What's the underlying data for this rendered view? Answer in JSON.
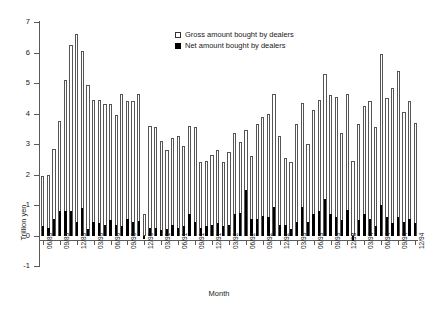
{
  "chart_data": {
    "type": "bar",
    "title": "",
    "xlabel": "Month",
    "ylabel": "Trillion yen",
    "ylim": [
      -1,
      7
    ],
    "ytick_labels": [
      "7",
      "6",
      "5",
      "4",
      "3",
      "2",
      "1",
      "0",
      "-1"
    ],
    "ytick_values": [
      7,
      6,
      5,
      4,
      3,
      2,
      1,
      0,
      -1
    ],
    "grid": false,
    "legend_position": "top-center",
    "legend": [
      {
        "name": "Gross amount bought by dealers",
        "swatch": "open-square"
      },
      {
        "name": "Net amount bought by dealers",
        "swatch": "filled-square"
      }
    ],
    "xtick_labels": [
      "06/89",
      "09/89",
      "12/89",
      "03/90",
      "06/90",
      "09/90",
      "12/90",
      "03/91",
      "06/91",
      "09/91",
      "12/91",
      "03/92",
      "06/92",
      "09/92",
      "12/92",
      "03/93",
      "06/93",
      "09/93",
      "12/93",
      "03/94",
      "06/94",
      "09/94",
      "12/94"
    ],
    "x": [
      "06/89",
      "07/89",
      "08/89",
      "09/89",
      "10/89",
      "11/89",
      "12/89",
      "01/90",
      "02/90",
      "03/90",
      "04/90",
      "05/90",
      "06/90",
      "07/90",
      "08/90",
      "09/90",
      "10/90",
      "11/90",
      "12/90",
      "01/91",
      "02/91",
      "03/91",
      "04/91",
      "05/91",
      "06/91",
      "07/91",
      "08/91",
      "09/91",
      "10/91",
      "11/91",
      "12/91",
      "01/92",
      "02/92",
      "03/92",
      "04/92",
      "05/92",
      "06/92",
      "07/92",
      "08/92",
      "09/92",
      "10/92",
      "11/92",
      "12/92",
      "01/93",
      "02/93",
      "03/93",
      "04/93",
      "05/93",
      "06/93",
      "07/93",
      "08/93",
      "09/93",
      "10/93",
      "11/93",
      "12/93",
      "01/94",
      "02/94",
      "03/94",
      "04/94",
      "05/94",
      "06/94",
      "07/94",
      "08/94",
      "09/94",
      "10/94",
      "11/94",
      "12/94"
    ],
    "series": [
      {
        "name": "Gross amount bought by dealers",
        "color": "#ffffff",
        "edge_color": "#555555",
        "values": [
          1.95,
          2.0,
          2.85,
          3.75,
          5.1,
          6.25,
          6.6,
          6.05,
          4.95,
          4.45,
          4.45,
          4.3,
          4.3,
          3.95,
          4.65,
          4.4,
          4.4,
          4.65,
          0.7,
          3.6,
          3.55,
          3.1,
          2.8,
          3.2,
          3.25,
          2.95,
          3.6,
          3.55,
          2.4,
          2.45,
          2.65,
          2.8,
          2.4,
          2.75,
          3.35,
          3.05,
          3.45,
          2.6,
          3.65,
          3.9,
          4.0,
          4.65,
          3.25,
          2.55,
          2.4,
          3.65,
          4.35,
          3.0,
          4.1,
          4.45,
          5.3,
          4.6,
          4.55,
          3.35,
          4.65,
          2.45,
          3.65,
          4.25,
          4.4,
          3.55,
          5.95,
          4.5,
          4.85,
          5.4,
          4.05,
          4.4,
          3.7
        ]
      },
      {
        "name": "Net amount bought by dealers",
        "color": "#000000",
        "values": [
          0.3,
          0.25,
          0.55,
          0.8,
          0.8,
          0.82,
          0.45,
          0.9,
          0.22,
          0.45,
          0.4,
          0.35,
          0.5,
          0.35,
          0.3,
          0.55,
          0.45,
          0.48,
          -0.12,
          0.25,
          0.25,
          0.18,
          0.2,
          0.35,
          0.25,
          0.3,
          0.7,
          0.45,
          0.25,
          0.3,
          0.35,
          0.42,
          0.3,
          0.35,
          0.7,
          0.75,
          1.5,
          0.55,
          0.55,
          0.65,
          0.6,
          0.95,
          0.35,
          0.35,
          0.22,
          0.45,
          0.95,
          0.45,
          0.7,
          0.8,
          1.2,
          0.7,
          0.6,
          0.5,
          0.85,
          -0.18,
          0.5,
          0.7,
          0.55,
          0.3,
          1.0,
          0.6,
          0.4,
          0.6,
          0.45,
          0.55,
          0.4
        ]
      }
    ]
  }
}
